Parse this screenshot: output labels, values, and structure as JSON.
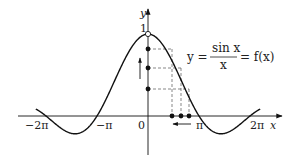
{
  "diagram": {
    "axes": {
      "x_label": "x",
      "y_label": "y",
      "origin_label": "0",
      "y_tick_label": "1",
      "x_tick_labels": [
        "−2π",
        "−π",
        "π",
        "2π"
      ]
    },
    "formula": {
      "lhs": "y =",
      "numerator": "sin x",
      "denominator": "x",
      "rhs": "= f(x)"
    },
    "annotations": {
      "open_circle_at": "(0, 1)",
      "y_axis_points": 3,
      "x_axis_points": 3,
      "arrow_y_axis": "up",
      "arrow_x_axis": "left"
    },
    "colors": {
      "line": "#111111",
      "dash": "#555555",
      "background": "#ffffff"
    }
  }
}
